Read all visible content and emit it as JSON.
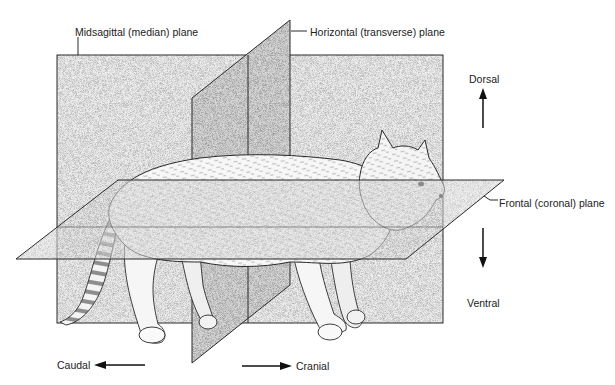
{
  "figure": {
    "planes": {
      "midsagittal": {
        "label": "Midsagittal (median) plane"
      },
      "horizontal": {
        "label": "Horizontal (transverse) plane"
      },
      "frontal": {
        "label": "Frontal (coronal) plane"
      }
    },
    "directions": {
      "dorsal": {
        "label": "Dorsal",
        "arrow": "up"
      },
      "ventral": {
        "label": "Ventral",
        "arrow": "down"
      },
      "caudal": {
        "label": "Caudal",
        "arrow": "left"
      },
      "cranial": {
        "label": "Cranial",
        "arrow": "right"
      }
    },
    "colors": {
      "line": "#2a2a2a",
      "plane_fill": "#e4e4e4",
      "plane_fill_dark": "#cfcfcf",
      "background": "#ffffff"
    }
  }
}
